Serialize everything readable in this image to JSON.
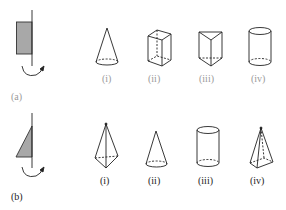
{
  "figure": {
    "rows": [
      {
        "id": "a",
        "label": "(a)",
        "source_shape": "rectangle",
        "shape_fill": "#a8a8a8",
        "options": [
          {
            "label": "(i)",
            "solid": "cone"
          },
          {
            "label": "(ii)",
            "solid": "cuboid"
          },
          {
            "label": "(iii)",
            "solid": "triangular-prism"
          },
          {
            "label": "(iv)",
            "solid": "cylinder"
          }
        ]
      },
      {
        "id": "b",
        "label": "(b)",
        "source_shape": "right-triangle",
        "shape_fill": "#a8a8a8",
        "options": [
          {
            "label": "(i)",
            "solid": "double-pyramid"
          },
          {
            "label": "(ii)",
            "solid": "cone"
          },
          {
            "label": "(iii)",
            "solid": "cylinder"
          },
          {
            "label": "(iv)",
            "solid": "pyramid"
          }
        ]
      }
    ],
    "colors": {
      "line": "#222222",
      "faded_label": "#9a9a9a",
      "shape_fill": "#a8a8a8"
    }
  }
}
